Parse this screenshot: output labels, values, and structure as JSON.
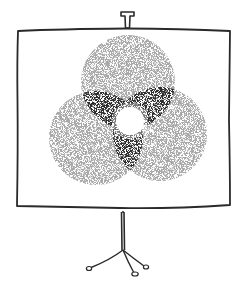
{
  "illustration": {
    "subject": "Projection screen on tripod stand showing a three-circle Venn diagram",
    "style": "hand-drawn ink with stippled shading",
    "colors": {
      "ink": "#2a2a2a",
      "stipple_light": "#9a9a9a",
      "stipple_dark": "#3a3a3a",
      "background": "#ffffff"
    },
    "venn": {
      "circles": [
        {
          "name": "top",
          "cx": 128,
          "cy": 82,
          "r": 47
        },
        {
          "name": "bottom-left",
          "cx": 96,
          "cy": 138,
          "r": 47
        },
        {
          "name": "bottom-right",
          "cx": 160,
          "cy": 134,
          "r": 47
        }
      ],
      "center_highlight": {
        "cx": 130,
        "cy": 121,
        "r": 14
      }
    }
  }
}
